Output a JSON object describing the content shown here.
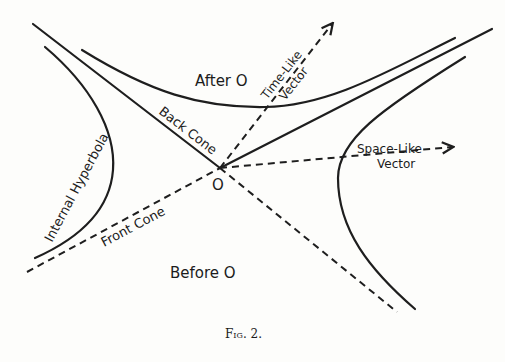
{
  "figure": {
    "caption": "Fig. 2.",
    "origin_label": "O",
    "regions": {
      "after": "After O",
      "before": "Before O"
    },
    "cones": {
      "back": "Back Cone",
      "front": "Front Cone"
    },
    "hyperbola_label": "Internal Hyperbola",
    "vectors": {
      "time_like": {
        "line1": "Time-Like",
        "line2": "Vector"
      },
      "space_like": {
        "line1": "Space-Like",
        "line2": "Vector"
      }
    },
    "colors": {
      "ink": "#1e1e1e",
      "paper": "#fdfdfb"
    }
  }
}
